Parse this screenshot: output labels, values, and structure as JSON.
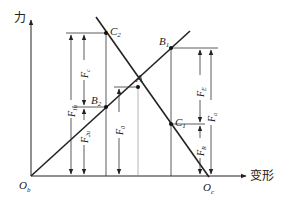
{
  "diagram": {
    "type": "bolt-joint force-deformation diagram",
    "axes": {
      "y_label": "力",
      "x_label": "变形"
    },
    "origins": {
      "bolt_origin": {
        "main": "O",
        "sub": "b"
      },
      "member_origin": {
        "main": "O",
        "sub": "c"
      }
    },
    "points": {
      "A": {
        "main": "A",
        "sub": ""
      },
      "B1": {
        "main": "B",
        "sub": "1"
      },
      "B2": {
        "main": "B",
        "sub": "2"
      },
      "C1": {
        "main": "C",
        "sub": "1"
      },
      "C2": {
        "main": "C",
        "sub": "2"
      }
    },
    "forces": {
      "F1u": {
        "main": "F",
        "sub": "1u"
      },
      "F2u": {
        "main": "F",
        "sub": "2u"
      },
      "Fc": {
        "main": "F",
        "sub": "c"
      },
      "F0": {
        "main": "F",
        "sub": "0"
      },
      "FE": {
        "main": "F",
        "sub": "E"
      },
      "FR": {
        "main": "F",
        "sub": "R"
      },
      "Fa": {
        "main": "F",
        "sub": "a"
      }
    },
    "colors": {
      "line": "#222222",
      "thin": "#333333",
      "background": "#ffffff"
    }
  }
}
